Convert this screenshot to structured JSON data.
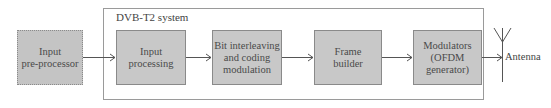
{
  "diagram": {
    "type": "block-diagram",
    "external_block": {
      "label_line1": "Input",
      "label_line2": "pre-processor",
      "border_style": "dotted"
    },
    "system": {
      "title": "DVB-T2 system",
      "blocks": [
        {
          "id": "input-processing",
          "line1": "Input",
          "line2": "processing",
          "line3": ""
        },
        {
          "id": "bit-interleaving",
          "line1": "Bit interleaving",
          "line2": "and coding",
          "line3": "modulation"
        },
        {
          "id": "frame-builder",
          "line1": "Frame",
          "line2": "builder",
          "line3": ""
        },
        {
          "id": "modulators",
          "line1": "Modulators",
          "line2": "(OFDM",
          "line3": "generator)"
        }
      ]
    },
    "output": {
      "label": "Antenna"
    },
    "colors": {
      "block_fill": "#c8c8c8",
      "block_border": "#8a8a8a",
      "line": "#555555",
      "frame": "#9a9a9a"
    },
    "flow": [
      "Input pre-processor",
      "Input processing",
      "Bit interleaving and coding modulation",
      "Frame builder",
      "Modulators (OFDM generator)",
      "Antenna"
    ]
  }
}
